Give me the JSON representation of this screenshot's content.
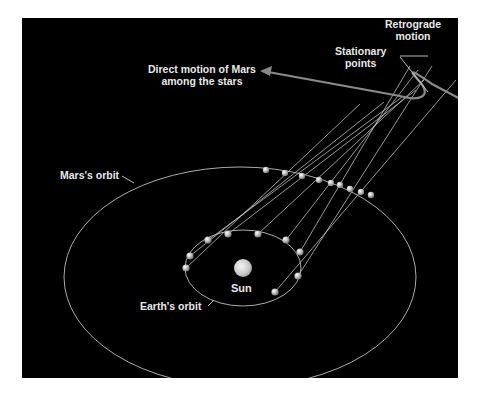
{
  "diagram": {
    "background": "#000000",
    "line_color": "#cfcfcf",
    "labels": {
      "retrograde_motion_line1": "Retrograde",
      "retrograde_motion_line2": "motion",
      "stationary_points_line1": "Stationary",
      "stationary_points_line2": "points",
      "direct_motion_line1": "Direct motion of Mars",
      "direct_motion_line2": "among the stars",
      "mars_orbit": "Mars's orbit",
      "earth_orbit": "Earth's orbit",
      "sun": "Sun"
    },
    "mars_orbit": {
      "cx": 240,
      "cy": 277,
      "rx": 176,
      "ry": 110
    },
    "earth_orbit": {
      "cx": 243,
      "cy": 268,
      "rx": 58,
      "ry": 38
    },
    "sun": {
      "cx": 243,
      "cy": 268,
      "r": 9
    },
    "earth_positions": [
      [
        186,
        268
      ],
      [
        190,
        256
      ],
      [
        208,
        240
      ],
      [
        228,
        234
      ],
      [
        258,
        234
      ],
      [
        286,
        240
      ],
      [
        300,
        252
      ],
      [
        298,
        276
      ],
      [
        275,
        292
      ]
    ],
    "mars_positions": [
      [
        266,
        170
      ],
      [
        285,
        173
      ],
      [
        302,
        176
      ],
      [
        319,
        180
      ],
      [
        331,
        183
      ],
      [
        340,
        185
      ],
      [
        350,
        189
      ],
      [
        361,
        192
      ],
      [
        371,
        195
      ]
    ],
    "sky_positions": [
      [
        360,
        104
      ],
      [
        384,
        102
      ],
      [
        402,
        97
      ],
      [
        416,
        90
      ],
      [
        424,
        80
      ],
      [
        418,
        70
      ],
      [
        410,
        66
      ],
      [
        432,
        66
      ],
      [
        456,
        80
      ]
    ]
  }
}
